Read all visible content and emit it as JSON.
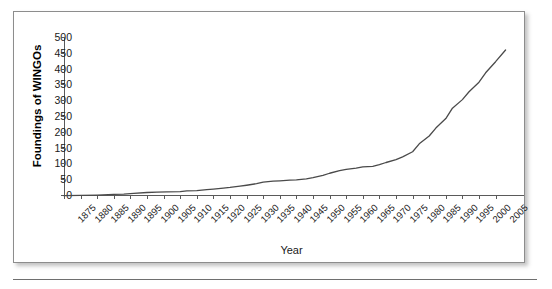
{
  "figure": {
    "background_color": "#ffffff",
    "border_color": "#8d8d8d",
    "line_color": "#4a4a4a",
    "axis_color": "#5a5a5a",
    "text_color": "#1a1a1a"
  },
  "chart_data": {
    "type": "line",
    "title": "",
    "xlabel": "Year",
    "ylabel": "Foundings of WINGOs",
    "xlim": [
      1875,
      2008
    ],
    "ylim": [
      0,
      500
    ],
    "grid": false,
    "legend": null,
    "ytick_labels": [
      "500",
      "450",
      "400",
      "350",
      "300",
      "250",
      "200",
      "150",
      "100",
      "50",
      "0"
    ],
    "ytick_values": [
      500,
      450,
      400,
      350,
      300,
      250,
      200,
      150,
      100,
      50,
      0
    ],
    "xtick_labels": [
      "1875",
      "1880",
      "1885",
      "1890",
      "1895",
      "1900",
      "1905",
      "1910",
      "1915",
      "1920",
      "1925",
      "1930",
      "1935",
      "1940",
      "1945",
      "1950",
      "1955",
      "1960",
      "1965",
      "1970",
      "1975",
      "1980",
      "1985",
      "1990",
      "1995",
      "2000",
      "2005"
    ],
    "xtick_values": [
      1875,
      1880,
      1885,
      1890,
      1895,
      1900,
      1905,
      1910,
      1915,
      1920,
      1925,
      1930,
      1935,
      1940,
      1945,
      1950,
      1955,
      1960,
      1965,
      1970,
      1975,
      1980,
      1985,
      1990,
      1995,
      2000,
      2005
    ],
    "series": [
      {
        "name": "Foundings of WINGOs",
        "x": [
          1875,
          1880,
          1885,
          1890,
          1893,
          1896,
          1900,
          1903,
          1906,
          1910,
          1912,
          1915,
          1918,
          1920,
          1923,
          1925,
          1928,
          1930,
          1933,
          1935,
          1938,
          1940,
          1943,
          1945,
          1948,
          1950,
          1953,
          1955,
          1958,
          1960,
          1963,
          1965,
          1968,
          1970,
          1972,
          1975,
          1977,
          1980,
          1982,
          1985,
          1987,
          1990,
          1992,
          1995,
          1997,
          2000,
          2002,
          2005,
          2008
        ],
        "y": [
          1,
          2,
          3,
          5,
          6,
          8,
          11,
          12,
          13,
          14,
          16,
          17,
          20,
          22,
          25,
          27,
          31,
          34,
          39,
          44,
          47,
          48,
          50,
          51,
          54,
          58,
          65,
          72,
          80,
          84,
          88,
          92,
          94,
          99,
          106,
          115,
          124,
          140,
          165,
          190,
          215,
          245,
          278,
          305,
          330,
          360,
          390,
          425,
          462
        ]
      }
    ]
  }
}
